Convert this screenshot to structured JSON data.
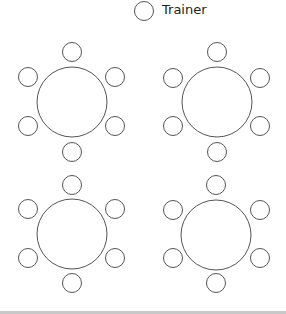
{
  "legend": {
    "label": "Trainer",
    "symbol": "circle"
  },
  "colors": {
    "stroke": "#555555",
    "background": "#ffffff",
    "bottom_bar": "#c8c8c8"
  },
  "layout": {
    "tables": [
      {
        "id": "table-1",
        "position": "top-left",
        "chairs": 6
      },
      {
        "id": "table-2",
        "position": "top-right",
        "chairs": 6
      },
      {
        "id": "table-3",
        "position": "bottom-left",
        "chairs": 6
      },
      {
        "id": "table-4",
        "position": "bottom-right",
        "chairs": 6
      }
    ]
  }
}
